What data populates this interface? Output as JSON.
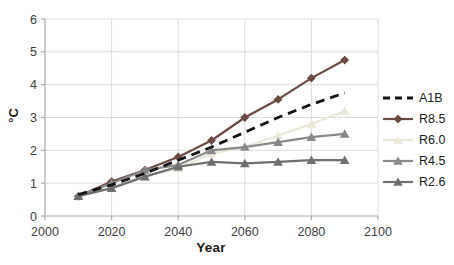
{
  "chart_data": {
    "type": "line",
    "title": "",
    "xlabel": "Year",
    "ylabel": "°C",
    "xlim": [
      2000,
      2100
    ],
    "ylim": [
      0,
      6
    ],
    "xticks": [
      2000,
      2020,
      2040,
      2060,
      2080,
      2100
    ],
    "yticks": [
      0,
      1,
      2,
      3,
      4,
      5,
      6
    ],
    "grid": true,
    "legend_position": "right",
    "x": [
      2010,
      2020,
      2030,
      2040,
      2050,
      2060,
      2070,
      2080,
      2090
    ],
    "series": [
      {
        "name": "A1B",
        "color": "#141414",
        "marker": "none",
        "dash": "9 6",
        "width": 2.8,
        "values": [
          0.65,
          0.95,
          1.3,
          1.7,
          2.1,
          2.55,
          3.0,
          3.4,
          3.75
        ]
      },
      {
        "name": "R8.5",
        "color": "#6B4A42",
        "marker": "diamond",
        "dash": "",
        "width": 2.2,
        "values": [
          0.6,
          1.05,
          1.4,
          1.8,
          2.3,
          3.0,
          3.55,
          4.2,
          4.75
        ]
      },
      {
        "name": "R6.0",
        "color": "#EAE6D8",
        "marker": "triangle",
        "dash": "",
        "width": 2.2,
        "values": [
          0.6,
          0.85,
          1.2,
          1.45,
          1.9,
          2.1,
          2.45,
          2.8,
          3.2
        ]
      },
      {
        "name": "R4.5",
        "color": "#898989",
        "marker": "triangle",
        "dash": "",
        "width": 2.2,
        "values": [
          0.6,
          1.0,
          1.4,
          1.55,
          2.0,
          2.1,
          2.25,
          2.4,
          2.5
        ]
      },
      {
        "name": "R2.6",
        "color": "#6F6F6F",
        "marker": "triangle",
        "dash": "",
        "width": 2.2,
        "values": [
          0.6,
          0.85,
          1.2,
          1.5,
          1.65,
          1.6,
          1.65,
          1.7,
          1.7
        ]
      }
    ],
    "draw_order": [
      1,
      2,
      3,
      4,
      0
    ],
    "colors": {
      "grid": "#DCDCDC",
      "axis": "#A9A9A9",
      "tick_text": "#3d3d3d"
    }
  }
}
